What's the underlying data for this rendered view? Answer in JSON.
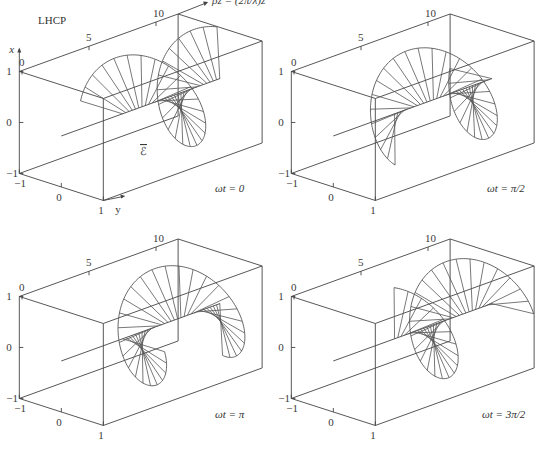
{
  "figure": {
    "title": "LHCP",
    "z_axis_label": "βz = (2π/λ)z",
    "x_axis_label": "x",
    "y_axis_label": "y",
    "field_label": "ℰ",
    "z_ticks": [
      "0",
      "5",
      "10"
    ],
    "x_ticks": [
      "1",
      "0",
      "−1"
    ],
    "y_ticks": [
      "−1",
      "0",
      "1"
    ]
  },
  "panels": [
    {
      "caption": "ωt = 0",
      "phase": 0
    },
    {
      "caption": "ωt = π/2",
      "phase": 1.5708
    },
    {
      "caption": "ωt = π",
      "phase": 3.14159
    },
    {
      "caption": "ωt = 3π/2",
      "phase": 4.71239
    }
  ],
  "chart_data": {
    "type": "3d-line",
    "title": "LHCP",
    "xlabel": "βz = (2π/λ)z",
    "ylabel": "x",
    "zlabel": "y",
    "axis_ranges": {
      "betaz": [
        0,
        12
      ],
      "x": [
        -1,
        1
      ],
      "y": [
        -1,
        1
      ]
    },
    "field_range_betaz": [
      4.7,
      12.5
    ],
    "series": [
      {
        "name": "ωt = 0",
        "omega_t": 0
      },
      {
        "name": "ωt = π/2",
        "omega_t": 1.5708
      },
      {
        "name": "ωt = π",
        "omega_t": 3.14159
      },
      {
        "name": "ωt = 3π/2",
        "omega_t": 4.71239
      }
    ]
  }
}
